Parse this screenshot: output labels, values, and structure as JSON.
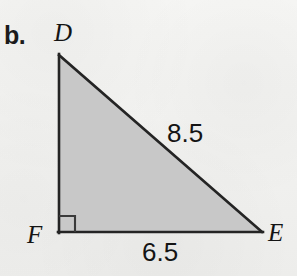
{
  "figure": {
    "part_label": "b.",
    "shape": "right-triangle",
    "vertices": {
      "top_left": {
        "name": "D",
        "x": 59,
        "y": 55
      },
      "bottom_left": {
        "name": "F",
        "x": 59,
        "y": 232
      },
      "bottom_right": {
        "name": "E",
        "x": 262,
        "y": 232
      }
    },
    "right_angle_at": "F",
    "measurements": {
      "hypotenuse_de": "8.5",
      "base_fe": "6.5"
    },
    "colors": {
      "fill": "#c8c8c8",
      "stroke": "#222222",
      "text": "#141414",
      "background": "#f3f3f1"
    }
  }
}
